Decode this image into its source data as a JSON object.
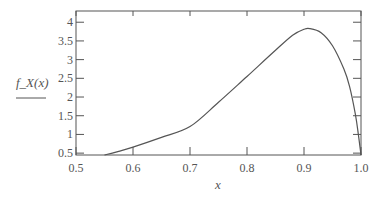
{
  "chart_data": {
    "type": "line",
    "title": "",
    "xlabel": "x",
    "ylabel": "f_X(x)",
    "xlim": [
      0.5,
      1.0
    ],
    "ylim": [
      0.45,
      4.3
    ],
    "xticks": [
      0.5,
      0.6,
      0.7,
      0.8,
      0.9,
      1.0
    ],
    "xtick_labels": [
      "0.5",
      "0.6",
      "0.7",
      "0.8",
      "0.9",
      "1.0"
    ],
    "yticks": [
      0.5,
      1,
      1.5,
      2,
      2.5,
      3,
      3.5,
      4
    ],
    "ytick_labels": [
      "0.5",
      "1",
      "1.5",
      "2",
      "2.5",
      "3",
      "3.5",
      "4"
    ],
    "grid": false,
    "legend": null,
    "series": [
      {
        "name": "f_X(x)",
        "x": [
          0.55,
          0.575,
          0.6,
          0.65,
          0.7,
          0.75,
          0.8,
          0.85,
          0.88,
          0.9,
          0.91,
          0.93,
          0.95,
          0.97,
          0.98,
          0.99,
          0.995,
          1.0
        ],
        "values": [
          0.45,
          0.55,
          0.66,
          0.92,
          1.21,
          1.86,
          2.55,
          3.25,
          3.65,
          3.81,
          3.83,
          3.72,
          3.37,
          2.75,
          2.28,
          1.55,
          1.05,
          0.45
        ]
      }
    ]
  },
  "colors": {
    "frame": "#555555",
    "curve": "#555555",
    "text": "#555555"
  }
}
